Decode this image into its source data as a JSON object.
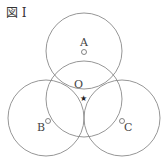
{
  "figure": {
    "title": "図 I",
    "labels": {
      "A": "A",
      "B": "B",
      "C": "C",
      "O": "O",
      "star": "★"
    },
    "circles": [
      {
        "name": "circle-A",
        "cx": 84,
        "cy": 52,
        "r": 38
      },
      {
        "name": "circle-O",
        "cx": 84,
        "cy": 96,
        "r": 38
      },
      {
        "name": "circle-B",
        "cx": 46,
        "cy": 118,
        "r": 38
      },
      {
        "name": "circle-C",
        "cx": 122,
        "cy": 118,
        "r": 38
      }
    ],
    "stroke_color": "#8a8a8a"
  }
}
